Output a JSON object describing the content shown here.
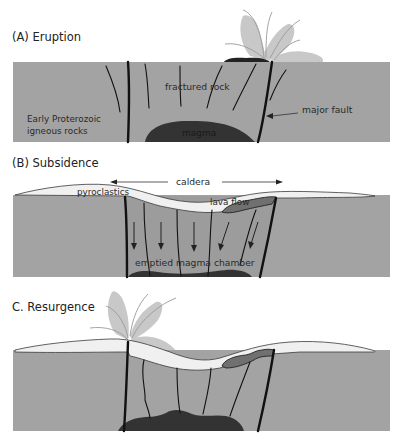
{
  "figure": {
    "colors": {
      "ground": "#a3a3a3",
      "surface_deposits": "#f0f0f0",
      "magma": "#333333",
      "lava_flow": "#707070",
      "plume": "#c8c8c8",
      "fault": "#111111"
    }
  },
  "panels": [
    {
      "id": "A",
      "title": "(A)  Eruption",
      "labels": {
        "fractured_rock": "fractured rock",
        "host_rock_line1": "Early Proterozoic",
        "host_rock_line2": "igneous rocks",
        "magma": "magma",
        "major_fault": "major fault"
      }
    },
    {
      "id": "B",
      "title": "(B)  Subsidence",
      "labels": {
        "caldera": "caldera",
        "pyroclastics": "pyroclastics",
        "lava_flow": "lava flow",
        "emptied_chamber": "emptied magma chamber"
      }
    },
    {
      "id": "C",
      "title": "C.  Resurgence",
      "labels": {}
    }
  ]
}
